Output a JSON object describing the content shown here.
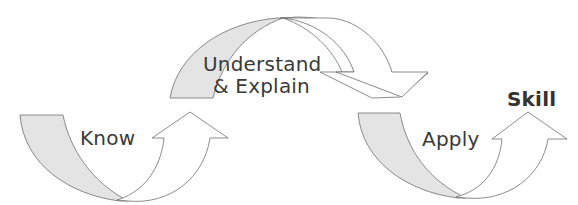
{
  "diagram": {
    "type": "process-flow",
    "colors": {
      "tail_fill": "#e4e4e4",
      "head_fill": "#ffffff",
      "stroke": "#6e6e6e",
      "text": "#3a3a3a",
      "background": "#ffffff"
    },
    "steps": [
      {
        "id": "know",
        "label": "Know"
      },
      {
        "id": "understand",
        "label_line1": "Understand",
        "label_line2": "& Explain"
      },
      {
        "id": "apply",
        "label": "Apply"
      }
    ],
    "outcome": {
      "label": "Skill"
    }
  }
}
